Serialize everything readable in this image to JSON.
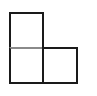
{
  "figure": {
    "type": "grid-shape",
    "cells": [
      {
        "id": "top",
        "row": 0,
        "col": 0
      },
      {
        "id": "bottom-left",
        "row": 1,
        "col": 0
      },
      {
        "id": "bottom-right",
        "row": 1,
        "col": 1
      }
    ],
    "colors": {
      "stroke": "#1a1a1a",
      "inner_divider": "#8a8a8a",
      "fill": "#ffffff",
      "background": "#ffffff"
    }
  }
}
